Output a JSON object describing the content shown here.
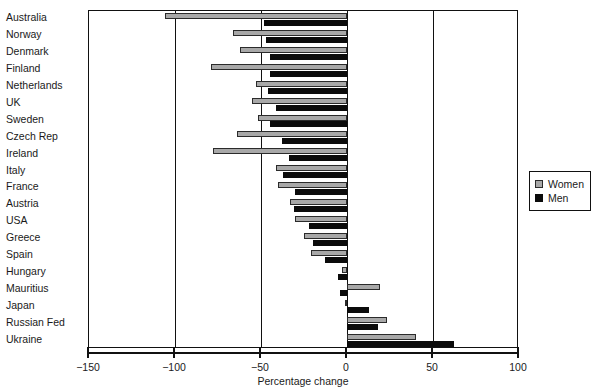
{
  "chart_data": {
    "type": "bar",
    "orientation": "horizontal",
    "title": "",
    "xlabel": "Percentage change",
    "ylabel": "",
    "xlim": [
      -150,
      100
    ],
    "xticks": [
      -150,
      -100,
      -50,
      0,
      50,
      100
    ],
    "xticklabels": [
      "−150",
      "−100",
      "−50",
      "0",
      "50",
      "100"
    ],
    "grid": true,
    "legend_position": "right",
    "legend": [
      "Women",
      "Men"
    ],
    "categories": [
      "Australia",
      "Norway",
      "Denmark",
      "Finland",
      "Netherlands",
      "UK",
      "Sweden",
      "Czech Rep",
      "Ireland",
      "Italy",
      "France",
      "Austria",
      "USA",
      "Greece",
      "Spain",
      "Hungary",
      "Mauritius",
      "Japan",
      "Russian Fed",
      "Ukraine"
    ],
    "series": [
      {
        "name": "Women",
        "color": "#a8a8a8",
        "values": [
          -106,
          -66,
          -62,
          -79,
          -53,
          -55,
          -52,
          -64,
          -78,
          -41,
          -40,
          -33,
          -30,
          -25,
          -21,
          -3,
          19,
          -1,
          23,
          40
        ]
      },
      {
        "name": "Men",
        "color": "#0b0b0b",
        "values": [
          -48,
          -47,
          -45,
          -45,
          -46,
          -41,
          -45,
          -38,
          -34,
          -37,
          -30,
          -31,
          -22,
          -20,
          -13,
          -5,
          -4,
          13,
          18,
          62
        ]
      }
    ]
  },
  "legend": {
    "women_label": "Women",
    "men_label": "Men"
  },
  "axis": {
    "title": "Percentage change",
    "tick_labels": [
      "−150",
      "−100",
      "−50",
      "0",
      "50",
      "100"
    ]
  }
}
